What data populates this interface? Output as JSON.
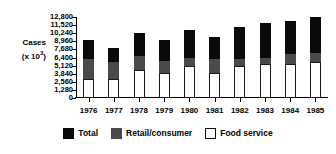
{
  "chart_data": {
    "type": "bar",
    "subtype": "stacked-bar",
    "title": "",
    "xlabel": "",
    "ylabel": "Cases (x 10³)",
    "ylabel_main": "Cases",
    "ylabel_units": "(x 10",
    "ylabel_exp": "3",
    "ylabel_units_close": ")",
    "categories": [
      "1976",
      "1977",
      "1978",
      "1979",
      "1980",
      "1981",
      "1982",
      "1983",
      "1984",
      "1985"
    ],
    "ylim": [
      0,
      12800
    ],
    "ytick_labels": [
      "0",
      "1,280",
      "2,560",
      "3,840",
      "5,120",
      "6,400",
      "7,680",
      "8,960",
      "10,240",
      "11,520",
      "12,800"
    ],
    "ytick_values": [
      0,
      1280,
      2560,
      3840,
      5120,
      6400,
      7680,
      8960,
      10240,
      11520,
      12800
    ],
    "grid": false,
    "legend_position": "bottom",
    "series": [
      {
        "name": "Total",
        "color": "#0a0a0a",
        "values": [
          9240,
          7900,
          10300,
          9240,
          10700,
          9700,
          11200,
          11850,
          12200,
          12800
        ]
      },
      {
        "name": "Retail/consumer",
        "color": "#4a4a4a",
        "values": [
          6200,
          5700,
          6600,
          5900,
          6350,
          6150,
          6200,
          6350,
          6900,
          7100
        ]
      },
      {
        "name": "Food service",
        "color": "#ffffff",
        "values": [
          3000,
          3000,
          4350,
          3900,
          5000,
          3900,
          5000,
          5300,
          5400,
          5700
        ]
      }
    ]
  },
  "legend": {
    "entries": [
      {
        "label": "Total",
        "swatch": "total"
      },
      {
        "label": "Retail/consumer",
        "swatch": "retail"
      },
      {
        "label": "Food service",
        "swatch": "foodservice"
      }
    ]
  }
}
